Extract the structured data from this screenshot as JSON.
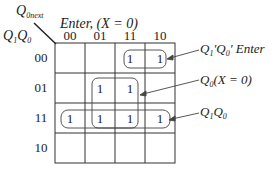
{
  "kmap": {
    "corner": {
      "output_label": "Q",
      "output_sub": "0next",
      "row_var_1": "Q",
      "row_var_1_sub": "1",
      "row_var_2": "Q",
      "row_var_2_sub": "0"
    },
    "column_header_title": "Enter, (X = 0)",
    "column_headers": [
      "00",
      "01",
      "11",
      "10"
    ],
    "row_headers": [
      "00",
      "01",
      "11",
      "10"
    ],
    "cells": [
      [
        "",
        "",
        "1",
        "1"
      ],
      [
        "",
        "1",
        "1",
        ""
      ],
      [
        "1",
        "1",
        "1",
        "1"
      ],
      [
        "",
        "",
        "",
        ""
      ]
    ]
  },
  "groups": [
    {
      "label": "Q₁′Q₀′ Enter",
      "label_parts": [
        "Q",
        "1",
        "′",
        "Q",
        "0",
        "′",
        " Enter"
      ],
      "cells": "row 00, cols 11-10"
    },
    {
      "label": "Q₀(X = 0)",
      "label_parts": [
        "Q",
        "0",
        "(X = 0)"
      ],
      "cells": "rows 01-11, cols 01-11"
    },
    {
      "label": "Q₁Q₀",
      "label_parts": [
        "Q",
        "1",
        "Q",
        "0"
      ],
      "cells": "row 11, all cols"
    }
  ]
}
